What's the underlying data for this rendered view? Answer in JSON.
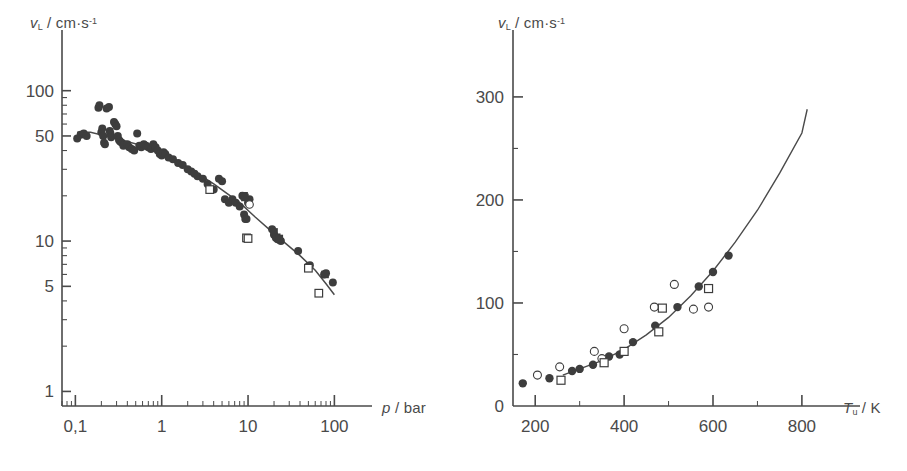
{
  "figure": {
    "background_color": "#ffffff",
    "ink_color": "#4a4a4a",
    "marker_color": "#3d3d3d",
    "panel_count": 2
  },
  "panels": {
    "left": {
      "name": "pressure-dependence-panel",
      "y_axis": {
        "label_symbol": "v",
        "label_subscript": "L",
        "label_unit": "cm",
        "label_unit_dot": "·",
        "label_unit_2": "s",
        "label_exponent": "-1",
        "label_full": "v_L / cm·s^-1",
        "scale": "log",
        "ticks": [
          "100",
          "50",
          "10",
          "5",
          "1"
        ],
        "tick_values": [
          100,
          50,
          10,
          5,
          1
        ],
        "range": [
          0.8,
          160
        ]
      },
      "x_axis": {
        "label_symbol": "p",
        "label_unit": "bar",
        "label_full": "p / bar",
        "scale": "log",
        "ticks": [
          "0,1",
          "1",
          "10",
          "100"
        ],
        "tick_values": [
          0.1,
          1,
          10,
          100
        ],
        "range": [
          0.07,
          160
        ]
      }
    },
    "right": {
      "name": "temperature-dependence-panel",
      "y_axis": {
        "label_symbol": "v",
        "label_subscript": "L",
        "label_unit": "cm",
        "label_unit_dot": "·",
        "label_unit_2": "s",
        "label_exponent": "-1",
        "label_full": "v_L / cm·s^-1",
        "scale": "linear",
        "ticks": [
          "0",
          "100",
          "200",
          "300"
        ],
        "tick_values": [
          0,
          100,
          200,
          300
        ],
        "range": [
          0,
          330
        ]
      },
      "x_axis": {
        "label_symbol": "T",
        "label_subscript": "u",
        "label_unit": "K",
        "label_full": "T_u / K",
        "scale": "linear",
        "ticks": [
          "200",
          "400",
          "600",
          "800"
        ],
        "tick_values": [
          200,
          400,
          600,
          800
        ],
        "range": [
          150,
          870
        ]
      }
    }
  },
  "chart_data": [
    {
      "type": "scatter",
      "name": "laminar-burning-velocity-vs-pressure",
      "title": "",
      "xlabel": "p / bar",
      "ylabel": "v_L / cm·s^-1",
      "xscale": "log",
      "yscale": "log",
      "xlim": [
        0.07,
        160
      ],
      "ylim": [
        0.8,
        160
      ],
      "xticks": [
        0.1,
        1,
        10,
        100
      ],
      "xticklabels": [
        "0,1",
        "1",
        "10",
        "100"
      ],
      "yticks": [
        1,
        5,
        10,
        50,
        100
      ],
      "yticklabels": [
        "1",
        "5",
        "10",
        "50",
        "100"
      ],
      "grid": false,
      "legend": "none",
      "series": [
        {
          "name": "filled-circles",
          "marker": "filled-circle",
          "points": [
            [
              0.105,
              48
            ],
            [
              0.115,
              51
            ],
            [
              0.125,
              52
            ],
            [
              0.135,
              50
            ],
            [
              0.185,
              77
            ],
            [
              0.19,
              80
            ],
            [
              0.2,
              53
            ],
            [
              0.205,
              56
            ],
            [
              0.21,
              50
            ],
            [
              0.215,
              45
            ],
            [
              0.22,
              44
            ],
            [
              0.23,
              76
            ],
            [
              0.245,
              78
            ],
            [
              0.25,
              54
            ],
            [
              0.255,
              52
            ],
            [
              0.26,
              49
            ],
            [
              0.28,
              62
            ],
            [
              0.29,
              60
            ],
            [
              0.3,
              58
            ],
            [
              0.31,
              50
            ],
            [
              0.32,
              47
            ],
            [
              0.33,
              46
            ],
            [
              0.345,
              45
            ],
            [
              0.36,
              43
            ],
            [
              0.4,
              44
            ],
            [
              0.42,
              42
            ],
            [
              0.45,
              41
            ],
            [
              0.48,
              40
            ],
            [
              0.52,
              52
            ],
            [
              0.55,
              43
            ],
            [
              0.58,
              42
            ],
            [
              0.62,
              44
            ],
            [
              0.66,
              43
            ],
            [
              0.7,
              42
            ],
            [
              0.75,
              41
            ],
            [
              0.8,
              44
            ],
            [
              0.85,
              42
            ],
            [
              0.9,
              40
            ],
            [
              0.95,
              38
            ],
            [
              1.0,
              37
            ],
            [
              1.05,
              39
            ],
            [
              1.1,
              38
            ],
            [
              1.2,
              36
            ],
            [
              1.35,
              35
            ],
            [
              1.55,
              33
            ],
            [
              1.75,
              32
            ],
            [
              2.0,
              30
            ],
            [
              2.2,
              29
            ],
            [
              2.4,
              28
            ],
            [
              2.6,
              27
            ],
            [
              3.0,
              26
            ],
            [
              3.4,
              24
            ],
            [
              4.0,
              22
            ],
            [
              4.6,
              26
            ],
            [
              5.0,
              25
            ],
            [
              5.4,
              19
            ],
            [
              6.0,
              18
            ],
            [
              6.6,
              19
            ],
            [
              7.2,
              18
            ],
            [
              8.0,
              17
            ],
            [
              8.6,
              20
            ],
            [
              9.0,
              15
            ],
            [
              9.3,
              14
            ],
            [
              9.6,
              14
            ],
            [
              10.0,
              18
            ],
            [
              10.4,
              19
            ],
            [
              19.0,
              12
            ],
            [
              20.0,
              11
            ],
            [
              21.0,
              10.5
            ],
            [
              22.0,
              10.3
            ],
            [
              23.0,
              10.2
            ],
            [
              24.0,
              10.0
            ],
            [
              38.0,
              8.6
            ],
            [
              50.0,
              6.8
            ],
            [
              52.0,
              6.9
            ],
            [
              76.0,
              6.0
            ],
            [
              80.0,
              6.1
            ],
            [
              96.0,
              5.3
            ]
          ]
        },
        {
          "name": "filled-squares",
          "marker": "filled-square",
          "points": [
            [
              9.0,
              20
            ],
            [
              9.2,
              19.5
            ],
            [
              20.0,
              11.5
            ],
            [
              21.5,
              10.6
            ],
            [
              23.0,
              10.4
            ],
            [
              78.0,
              6.0
            ]
          ]
        },
        {
          "name": "open-squares",
          "marker": "open-square",
          "points": [
            [
              3.6,
              22
            ],
            [
              9.6,
              10.5
            ],
            [
              10.0,
              10.4
            ],
            [
              50.0,
              6.6
            ],
            [
              66.0,
              4.5
            ]
          ]
        },
        {
          "name": "open-circles",
          "marker": "open-circle",
          "points": [
            [
              10.4,
              17.5
            ]
          ]
        }
      ],
      "fit_line": {
        "name": "correlation-curve",
        "description": "power-law correlation through data, flat below ~0.15 bar",
        "points": [
          [
            0.105,
            53
          ],
          [
            0.15,
            53
          ],
          [
            0.3,
            48
          ],
          [
            0.6,
            43
          ],
          [
            1.0,
            38
          ],
          [
            2.0,
            31
          ],
          [
            4.0,
            24
          ],
          [
            8.0,
            18
          ],
          [
            12.0,
            14.5
          ],
          [
            20.0,
            11.2
          ],
          [
            40.0,
            8.0
          ],
          [
            60.0,
            6.4
          ],
          [
            80.0,
            5.2
          ],
          [
            100.0,
            4.4
          ]
        ]
      }
    },
    {
      "type": "scatter",
      "name": "laminar-burning-velocity-vs-unburned-temperature",
      "title": "",
      "xlabel": "T_u / K",
      "ylabel": "v_L / cm·s^-1",
      "xscale": "linear",
      "yscale": "linear",
      "xlim": [
        150,
        870
      ],
      "ylim": [
        0,
        330
      ],
      "xticks": [
        200,
        400,
        600,
        800
      ],
      "xticklabels": [
        "200",
        "400",
        "600",
        "800"
      ],
      "yticks": [
        0,
        100,
        200,
        300
      ],
      "yticklabels": [
        "0",
        "100",
        "200",
        "300"
      ],
      "grid": false,
      "legend": "none",
      "series": [
        {
          "name": "filled-circles",
          "marker": "filled-circle",
          "points": [
            [
              172,
              22
            ],
            [
              232,
              27
            ],
            [
              283,
              34
            ],
            [
              300,
              36
            ],
            [
              330,
              40
            ],
            [
              366,
              48
            ],
            [
              390,
              50
            ],
            [
              420,
              62
            ],
            [
              470,
              78
            ],
            [
              520,
              96
            ],
            [
              568,
              116
            ],
            [
              600,
              130
            ],
            [
              635,
              146
            ]
          ]
        },
        {
          "name": "open-circles",
          "marker": "open-circle",
          "points": [
            [
              205,
              30
            ],
            [
              255,
              38
            ],
            [
              333,
              53
            ],
            [
              350,
              46
            ],
            [
              400,
              75
            ],
            [
              468,
              96
            ],
            [
              513,
              118
            ],
            [
              556,
              94
            ],
            [
              590,
              96
            ]
          ]
        },
        {
          "name": "open-squares",
          "marker": "open-square",
          "points": [
            [
              258,
              25
            ],
            [
              355,
              42
            ],
            [
              400,
              53
            ],
            [
              478,
              72
            ],
            [
              486,
              95
            ],
            [
              590,
              114
            ]
          ]
        }
      ],
      "fit_line": {
        "name": "correlation-curve",
        "description": "power-law T^alpha correlation rising steeply above 600 K",
        "points": [
          [
            262,
            30
          ],
          [
            300,
            36
          ],
          [
            350,
            44
          ],
          [
            400,
            55
          ],
          [
            450,
            69
          ],
          [
            500,
            86
          ],
          [
            550,
            107
          ],
          [
            600,
            131
          ],
          [
            650,
            159
          ],
          [
            700,
            190
          ],
          [
            750,
            226
          ],
          [
            800,
            265
          ],
          [
            812,
            288
          ]
        ]
      }
    }
  ]
}
